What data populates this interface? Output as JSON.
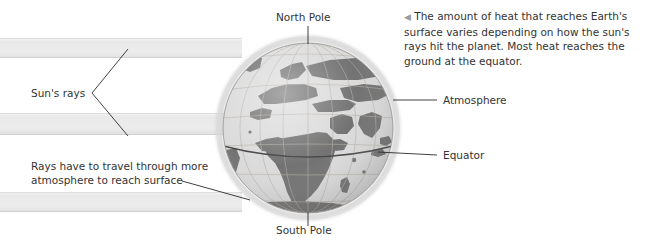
{
  "figure": {
    "title_semantic": "earth-sun-rays-heat-diagram",
    "background_color": "#ffffff"
  },
  "caption": {
    "marker_icon": "left-triangle-marker",
    "text": "The amount of heat that reaches Earth's surface varies depending on how the sun's rays hit the planet. Most heat reaches the ground at the equator."
  },
  "labels": {
    "north_pole": "North Pole",
    "south_pole": "South Pole",
    "suns_rays": "Sun's rays",
    "atmosphere": "Atmosphere",
    "equator": "Equator",
    "rays_travel_line1": "Rays have to travel through more",
    "rays_travel_line2": "atmosphere to reach surface"
  },
  "colors": {
    "ray_band": "#ececec",
    "ray_band_edge": "#d8d8d8",
    "land": "#6b6b6b",
    "ocean": "#d9d9d9",
    "graticule": "#b0a8a0",
    "equator_line": "#3d3d3d",
    "atmosphere_halo": "#e6e6e6",
    "leader_line": "#2b2b2b",
    "text": "#333333",
    "marker": "#9b9b9b"
  },
  "globe": {
    "center_x": 308,
    "center_y": 128,
    "radius": 85,
    "north_pole_point": {
      "x": 308,
      "y": 43
    },
    "south_pole_point": {
      "x": 308,
      "y": 213
    },
    "equator_label_anchor": {
      "x": 386,
      "y": 155
    },
    "atmosphere_label_anchor": {
      "x": 390,
      "y": 100
    }
  },
  "ray_bands": [
    {
      "name": "upper-ray-band",
      "x": 0,
      "y": 38,
      "width": 240,
      "height": 20
    },
    {
      "name": "middle-ray-band",
      "x": 0,
      "y": 113,
      "width": 240,
      "height": 22
    },
    {
      "name": "lower-ray-band",
      "x": 0,
      "y": 192,
      "width": 240,
      "height": 20
    }
  ]
}
